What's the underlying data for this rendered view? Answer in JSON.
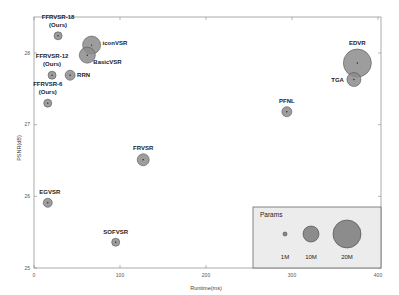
{
  "chart_data": {
    "type": "scatter",
    "subtype": "bubble",
    "title": "",
    "xlabel": "Runtime(ms)",
    "ylabel": "PSNR(dB)",
    "xlim": [
      0,
      400
    ],
    "ylim": [
      25,
      28.5
    ],
    "xticks": [
      0,
      100,
      200,
      300,
      400
    ],
    "yticks": [
      25,
      26,
      27,
      28
    ],
    "grid": false,
    "bubble_color": "#8c8c8c",
    "points": [
      {
        "name": "FFRVSR-18",
        "sublabel": "(Ours)",
        "x": 28,
        "y": 28.24,
        "params_m": 1.5,
        "r": 4
      },
      {
        "name": "iconVSR",
        "sublabel": "",
        "x": 67,
        "y": 28.11,
        "params_m": 8.7,
        "r": 9
      },
      {
        "name": "BasicVSR",
        "sublabel": "",
        "x": 62,
        "y": 27.97,
        "params_m": 6.3,
        "r": 8
      },
      {
        "name": "FFRVSR-12",
        "sublabel": "(Ours)",
        "x": 21,
        "y": 27.69,
        "params_m": 1.0,
        "r": 4
      },
      {
        "name": "RRN",
        "sublabel": "",
        "x": 42,
        "y": 27.69,
        "params_m": 3.4,
        "r": 5
      },
      {
        "name": "FFRVSR-6",
        "sublabel": "(Ours)",
        "x": 16,
        "y": 27.3,
        "params_m": 0.5,
        "r": 4
      },
      {
        "name": "FRVSR",
        "sublabel": "",
        "x": 127,
        "y": 26.51,
        "params_m": 5.1,
        "r": 6
      },
      {
        "name": "EGVSR",
        "sublabel": "",
        "x": 16,
        "y": 25.91,
        "params_m": 2.7,
        "r": 4.5
      },
      {
        "name": "SOFVSR",
        "sublabel": "",
        "x": 95,
        "y": 25.36,
        "params_m": 1.0,
        "r": 4
      },
      {
        "name": "PFNL",
        "sublabel": "",
        "x": 294,
        "y": 27.18,
        "params_m": 3.0,
        "r": 5
      },
      {
        "name": "EDVR",
        "sublabel": "",
        "x": 376,
        "y": 27.86,
        "params_m": 20.6,
        "r": 14
      },
      {
        "name": "TGA",
        "sublabel": "",
        "x": 372,
        "y": 27.63,
        "params_m": 5.8,
        "r": 7
      }
    ],
    "legend": {
      "title": "Params",
      "position": "lower right",
      "entries": [
        {
          "label": "1M",
          "r": 2
        },
        {
          "label": "10M",
          "r": 8
        },
        {
          "label": "20M",
          "r": 14
        }
      ]
    }
  }
}
